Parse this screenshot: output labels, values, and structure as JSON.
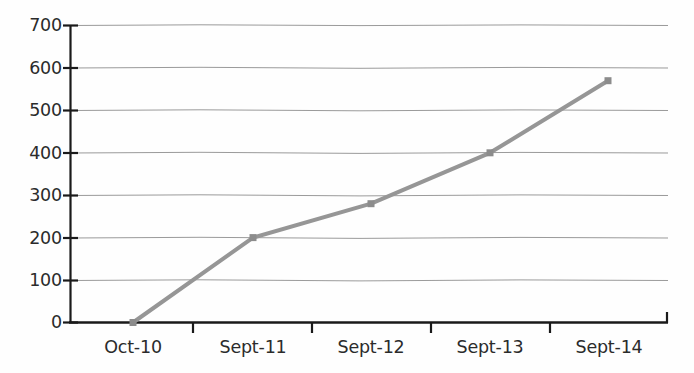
{
  "chart_data": {
    "type": "line",
    "title": "",
    "subtitle": "",
    "xlabel": "",
    "ylabel": "",
    "categories": [
      "Oct-10",
      "Sept-11",
      "Sept-12",
      "Sept-13",
      "Sept-14"
    ],
    "values": [
      0,
      200,
      280,
      400,
      570
    ],
    "series": [
      {
        "name": "",
        "values": [
          0,
          200,
          280,
          400,
          570
        ]
      }
    ],
    "ylim": [
      0,
      700
    ],
    "yticks": [
      0,
      100,
      200,
      300,
      400,
      500,
      600,
      700
    ],
    "ytick_labels": [
      "0",
      "100",
      "200",
      "300",
      "400",
      "500",
      "600",
      "700"
    ],
    "xtick_labels": [
      "Oct-10",
      "Sept-11",
      "Sept-12",
      "Sept-13",
      "Sept-14"
    ],
    "grid": true,
    "grid_axis": "y",
    "legend": false,
    "legend_position": "none",
    "annotations": [],
    "colors": {
      "line": "#969696",
      "marker": "#8c8c8c",
      "gridline": "#8a8a8a",
      "axis": "#1a1a1a",
      "text": "#2b2b2b",
      "background": "#fefefe"
    },
    "markers": "square",
    "line_width": 4
  }
}
